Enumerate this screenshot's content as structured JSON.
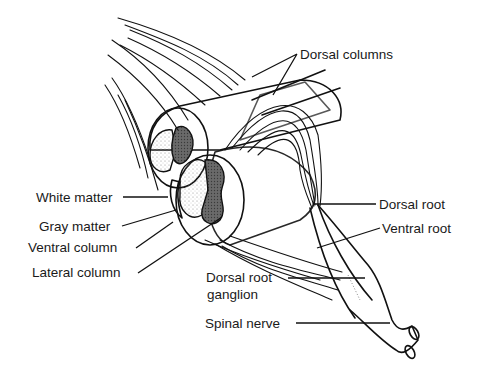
{
  "figure": {
    "colors": {
      "ink": "#111111",
      "background": "#ffffff",
      "gray_matter": "#555555",
      "stipple": "#9a9a9a"
    }
  },
  "labels": {
    "dorsal_columns": "Dorsal columns",
    "white_matter": "White matter",
    "gray_matter": "Gray matter",
    "ventral_column": "Ventral column",
    "lateral_column": "Lateral column",
    "dorsal_root": "Dorsal root",
    "ventral_root": "Ventral root",
    "dorsal_root_ganglion_line1": "Dorsal root",
    "dorsal_root_ganglion_line2": "ganglion",
    "spinal_nerve": "Spinal nerve"
  }
}
